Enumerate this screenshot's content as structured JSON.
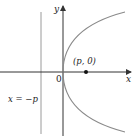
{
  "diagram": {
    "type": "parabola-focus-directrix",
    "axes": {
      "x_label": "x",
      "y_label": "y",
      "origin_label": "0"
    },
    "focus": {
      "label": "(p, 0)"
    },
    "directrix": {
      "label": "x = −p"
    },
    "colors": {
      "axis": "#333333",
      "curve": "#8a8a8a",
      "directrix": "#9a9a9a",
      "point": "#111111"
    }
  }
}
